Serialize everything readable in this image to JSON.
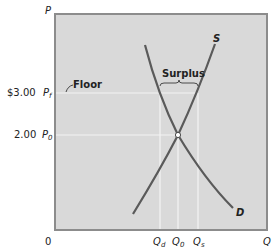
{
  "diagram": {
    "axes": {
      "y_label": "P",
      "x_label": "Q",
      "origin": "0"
    },
    "price_levels": [
      {
        "value": "$3.00",
        "symbol": "P",
        "sub": "f"
      },
      {
        "value": "2.00",
        "symbol": "P",
        "sub": "0"
      }
    ],
    "quantity_levels": [
      {
        "symbol": "Q",
        "sub": "d"
      },
      {
        "symbol": "Q",
        "sub": "0"
      },
      {
        "symbol": "Q",
        "sub": "s"
      }
    ],
    "curves": {
      "supply": "S",
      "demand": "D"
    },
    "annotations": {
      "floor": "Floor",
      "surplus": "Surplus"
    },
    "colors": {
      "plot_bg": "#d9d9d9",
      "curve": "#5a5a5a",
      "gridline": "#f2f2f2",
      "axis_border": "#8c8c8c"
    }
  }
}
